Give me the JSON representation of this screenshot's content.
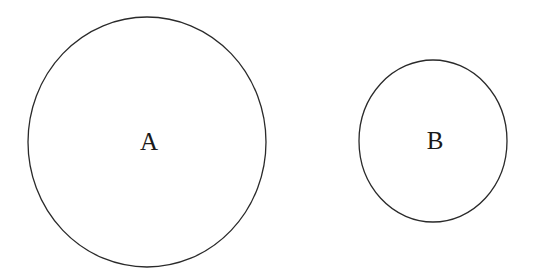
{
  "diagram": {
    "type": "venn-disjoint",
    "stroke_color": "#2a2a2a",
    "background": "#ffffff",
    "shapes": [
      {
        "id": "A",
        "label": "A",
        "cx": 147,
        "cy": 142,
        "rx": 119,
        "ry": 125
      },
      {
        "id": "B",
        "label": "B",
        "cx": 433,
        "cy": 141,
        "rx": 74,
        "ry": 81
      }
    ]
  }
}
